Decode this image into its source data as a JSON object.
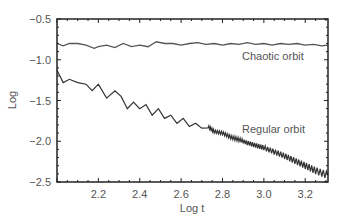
{
  "chart_data": {
    "type": "line",
    "title": "",
    "xlabel": "Log t",
    "ylabel": "Log",
    "xlim": [
      2.0,
      3.31
    ],
    "ylim": [
      -2.5,
      -0.5
    ],
    "xticks": [
      2.2,
      2.4,
      2.6,
      2.8,
      3.0,
      3.2
    ],
    "xtick_labels": [
      "2.2",
      "2.4",
      "2.6",
      "2.8",
      "3.0",
      "3.2"
    ],
    "yticks": [
      -0.5,
      -1.0,
      -1.5,
      -2.0,
      -2.5
    ],
    "ytick_labels": [
      "−0.5",
      "−1.0",
      "−1.5",
      "−2.0",
      "−2.5"
    ],
    "grid": false,
    "legend": null,
    "annotations": [
      {
        "text": "Chaotic orbit",
        "x": 2.95,
        "y": -0.98
      },
      {
        "text": "Regular orbit",
        "x": 2.9,
        "y": -1.63
      }
    ],
    "series": [
      {
        "name": "Chaotic orbit",
        "color": "#555555",
        "x": [
          2.0,
          2.03,
          2.06,
          2.1,
          2.14,
          2.18,
          2.2,
          2.24,
          2.28,
          2.32,
          2.36,
          2.4,
          2.44,
          2.48,
          2.52,
          2.56,
          2.6,
          2.64,
          2.68,
          2.72,
          2.76,
          2.8,
          2.84,
          2.88,
          2.92,
          2.96,
          3.0,
          3.04,
          3.08,
          3.12,
          3.16,
          3.2,
          3.24,
          3.28,
          3.31
        ],
        "y": [
          -0.8,
          -0.83,
          -0.8,
          -0.8,
          -0.82,
          -0.86,
          -0.84,
          -0.82,
          -0.85,
          -0.8,
          -0.84,
          -0.82,
          -0.84,
          -0.78,
          -0.8,
          -0.8,
          -0.82,
          -0.8,
          -0.79,
          -0.81,
          -0.8,
          -0.82,
          -0.8,
          -0.81,
          -0.79,
          -0.81,
          -0.8,
          -0.82,
          -0.8,
          -0.81,
          -0.8,
          -0.82,
          -0.81,
          -0.83,
          -0.82
        ]
      },
      {
        "name": "Regular orbit",
        "color": "#333333",
        "x": [
          2.0,
          2.03,
          2.06,
          2.1,
          2.14,
          2.17,
          2.2,
          2.24,
          2.28,
          2.31,
          2.34,
          2.37,
          2.4,
          2.43,
          2.46,
          2.49,
          2.52,
          2.55,
          2.58,
          2.61,
          2.64,
          2.67,
          2.7,
          2.73,
          2.76,
          2.8,
          2.84,
          2.88,
          2.92,
          2.96,
          3.0,
          3.05,
          3.1,
          3.15,
          3.2,
          3.25,
          3.31
        ],
        "y": [
          -1.13,
          -1.28,
          -1.24,
          -1.28,
          -1.3,
          -1.38,
          -1.3,
          -1.47,
          -1.38,
          -1.45,
          -1.6,
          -1.52,
          -1.6,
          -1.55,
          -1.68,
          -1.6,
          -1.72,
          -1.68,
          -1.78,
          -1.72,
          -1.82,
          -1.78,
          -1.84,
          -1.82,
          -1.88,
          -1.9,
          -1.95,
          -1.98,
          -2.02,
          -2.05,
          -2.08,
          -2.13,
          -2.18,
          -2.24,
          -2.3,
          -2.36,
          -2.42
        ]
      }
    ]
  }
}
